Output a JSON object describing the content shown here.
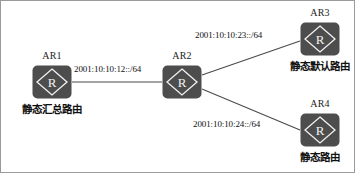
{
  "diagram": {
    "type": "network-topology",
    "background_color": "#ffffff",
    "border_color": "#9a9a9a",
    "node_fill_color": "#4d4d4d",
    "node_glyph_color": "#f2f2f2",
    "link_color": "#4a4a4a"
  },
  "nodes": [
    {
      "id": "ar1",
      "title": "AR1",
      "caption": "静态汇总路由",
      "icon": "router-icon"
    },
    {
      "id": "ar2",
      "title": "AR2",
      "caption": "",
      "icon": "router-icon"
    },
    {
      "id": "ar3",
      "title": "AR3",
      "caption": "静态默认路由",
      "icon": "router-icon"
    },
    {
      "id": "ar4",
      "title": "AR4",
      "caption": "静态路由",
      "icon": "router-icon"
    }
  ],
  "links": [
    {
      "id": "link-12",
      "from": "ar1",
      "to": "ar2",
      "label": "2001:10:10:12::/64"
    },
    {
      "id": "link-23",
      "from": "ar2",
      "to": "ar3",
      "label": "2001:10:10:23::/64"
    },
    {
      "id": "link-24",
      "from": "ar2",
      "to": "ar4",
      "label": "2001:10:10:24::/64"
    }
  ],
  "router_glyph": "R"
}
